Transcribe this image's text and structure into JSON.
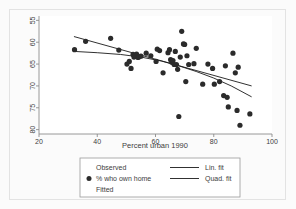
{
  "chart_data": {
    "type": "scatter",
    "title": "",
    "xlabel": "Percent urban 1990",
    "ylabel": "",
    "xlim": [
      20,
      100
    ],
    "ylim": [
      54,
      81
    ],
    "xticks": [
      20,
      40,
      60,
      80,
      100
    ],
    "yticks": [
      55,
      60,
      65,
      70,
      75,
      80
    ],
    "grid": false,
    "legend_position": "below-axis",
    "series": [
      {
        "name": "% who own home",
        "type": "scatter",
        "marker": "filled-circle",
        "color": "#2b2b2b",
        "points": [
          [
            32.2,
            73.3
          ],
          [
            36.0,
            75.2
          ],
          [
            44.6,
            75.9
          ],
          [
            47.4,
            73.2
          ],
          [
            50.2,
            70.0
          ],
          [
            51.0,
            70.6
          ],
          [
            51.6,
            69.0
          ],
          [
            52.3,
            72.2
          ],
          [
            52.6,
            71.6
          ],
          [
            53.0,
            71.9
          ],
          [
            53.5,
            72.3
          ],
          [
            54.0,
            71.5
          ],
          [
            54.4,
            71.7
          ],
          [
            55.0,
            71.8
          ],
          [
            56.8,
            72.5
          ],
          [
            58.4,
            71.9
          ],
          [
            60.2,
            70.6
          ],
          [
            60.6,
            73.4
          ],
          [
            61.4,
            73.1
          ],
          [
            62.6,
            68.0
          ],
          [
            64.3,
            72.6
          ],
          [
            64.8,
            73.3
          ],
          [
            65.2,
            71.0
          ],
          [
            65.6,
            70.4
          ],
          [
            66.0,
            70.8
          ],
          [
            66.4,
            69.9
          ],
          [
            66.8,
            72.9
          ],
          [
            67.2,
            69.9
          ],
          [
            67.6,
            68.8
          ],
          [
            68.0,
            58.0
          ],
          [
            68.5,
            71.6
          ],
          [
            69.0,
            77.5
          ],
          [
            69.6,
            74.6
          ],
          [
            70.0,
            74.5
          ],
          [
            70.4,
            66.0
          ],
          [
            70.8,
            71.9
          ],
          [
            71.4,
            69.9
          ],
          [
            73.2,
            70.1
          ],
          [
            74.0,
            73.6
          ],
          [
            76.2,
            65.4
          ],
          [
            78.0,
            70.0
          ],
          [
            79.6,
            69.0
          ],
          [
            80.2,
            65.4
          ],
          [
            82.0,
            66.0
          ],
          [
            83.4,
            62.8
          ],
          [
            84.0,
            69.6
          ],
          [
            84.6,
            62.4
          ],
          [
            85.0,
            60.2
          ],
          [
            86.6,
            72.5
          ],
          [
            87.4,
            68.0
          ],
          [
            88.0,
            59.4
          ],
          [
            88.4,
            69.3
          ],
          [
            89.0,
            56.0
          ],
          [
            92.4,
            58.6
          ]
        ]
      },
      {
        "name": "Lin. fit",
        "type": "line",
        "color": "#1a1a1a",
        "points": [
          [
            32.0,
            76.3
          ],
          [
            93.0,
            65.0
          ]
        ]
      },
      {
        "name": "Quad. fit",
        "type": "line",
        "color": "#1a1a1a",
        "points": [
          [
            32.0,
            72.9
          ],
          [
            40.0,
            72.6
          ],
          [
            48.0,
            72.2
          ],
          [
            55.0,
            71.6
          ],
          [
            62.0,
            70.7
          ],
          [
            68.0,
            69.6
          ],
          [
            74.0,
            68.3
          ],
          [
            80.0,
            66.8
          ],
          [
            86.0,
            65.0
          ],
          [
            93.0,
            62.5
          ]
        ]
      }
    ]
  },
  "axis": {
    "x_title": "Percent urban 1990",
    "x_tick_labels": [
      "20",
      "40",
      "60",
      "80",
      "100"
    ],
    "y_tick_labels": [
      "80",
      "75",
      "70",
      "65",
      "60",
      "55"
    ]
  },
  "legend": {
    "col1_header": "Observed",
    "col1_marker_label": "% who own home",
    "col1_footer": "Fitted",
    "col2_item1": "Lin. fit",
    "col2_item2": "Quad. fit"
  },
  "colors": {
    "marker": "#2b2b2b",
    "line": "#1a1a1a",
    "axis": "#8c8c8c",
    "frame": "#e3e3e3",
    "panel": "#ffffff",
    "page": "#fbfbfb"
  }
}
